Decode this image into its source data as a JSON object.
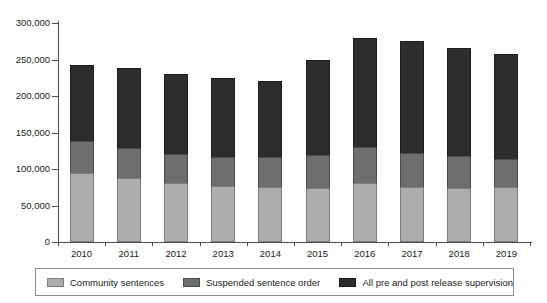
{
  "chart_data": {
    "type": "bar",
    "stacked": true,
    "title": "",
    "subtitle": "",
    "xlabel": "",
    "ylabel": "",
    "categories": [
      "2010",
      "2011",
      "2012",
      "2013",
      "2014",
      "2015",
      "2016",
      "2017",
      "2018",
      "2019"
    ],
    "series": [
      {
        "name": "Community sentences",
        "color": "#adadad",
        "values": [
          95000,
          88000,
          81000,
          77000,
          75000,
          74000,
          81000,
          75000,
          74000,
          75000
        ]
      },
      {
        "name": "Suspended sentence order",
        "color": "#6e6e6e",
        "values": [
          43000,
          41000,
          39000,
          39000,
          41000,
          45000,
          49000,
          47000,
          44000,
          39000
        ]
      },
      {
        "name": "All pre and post release supervision",
        "color": "#2d2d2d",
        "values": [
          105000,
          110000,
          110000,
          109000,
          105000,
          130000,
          149000,
          153000,
          148000,
          144000
        ]
      }
    ],
    "totals": [
      243000,
      239000,
      230000,
      225000,
      221000,
      249000,
      279000,
      275000,
      266000,
      258000
    ],
    "ylim": [
      0,
      300000
    ],
    "yticks": [
      0,
      50000,
      100000,
      150000,
      200000,
      250000,
      300000
    ],
    "ytick_labels": [
      "0",
      "50,000",
      "100,000",
      "150,000",
      "200,000",
      "250,000",
      "300,000"
    ],
    "grid": false,
    "legend_position": "bottom"
  },
  "legend": {
    "items": [
      {
        "label": "Community sentences",
        "swatch": "swatch-light-gray"
      },
      {
        "label": "Suspended sentence order",
        "swatch": "swatch-medium-gray"
      },
      {
        "label": "All pre and post release supervision",
        "swatch": "swatch-dark-gray"
      }
    ]
  }
}
